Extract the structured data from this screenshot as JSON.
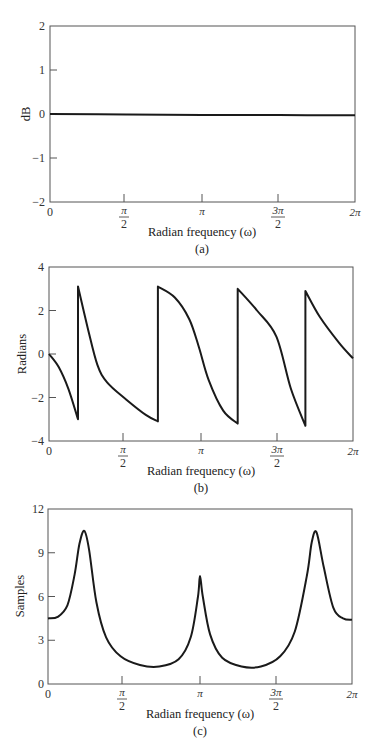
{
  "figure": {
    "panels": [
      {
        "id": "a",
        "caption": "(a)",
        "ylabel": "dB",
        "xlabel": "Radian frequency (ω)",
        "ytick_labels": [
          "2",
          "1",
          "0",
          "−1",
          "−2"
        ],
        "xtick_labels": [
          "0",
          "π/2",
          "π",
          "3π/2",
          "2π"
        ]
      },
      {
        "id": "b",
        "caption": "(b)",
        "ylabel": "Radians",
        "xlabel": "Radian frequency (ω)",
        "ytick_labels": [
          "4",
          "2",
          "0",
          "−2",
          "−4"
        ],
        "xtick_labels": [
          "0",
          "π/2",
          "π",
          "3π/2",
          "2π"
        ]
      },
      {
        "id": "c",
        "caption": "(c)",
        "ylabel": "Samples",
        "xlabel": "Radian frequency (ω)",
        "ytick_labels": [
          "12",
          "9",
          "6",
          "3",
          "0"
        ],
        "xtick_labels": [
          "0",
          "π/2",
          "π",
          "3π/2",
          "2π"
        ]
      }
    ],
    "line_color": "#1a1a1a",
    "frame_color": "#555555"
  },
  "chart_data": [
    {
      "type": "line",
      "title": "",
      "caption": "(a)",
      "xlabel": "Radian frequency (ω)",
      "ylabel": "dB",
      "xlim": [
        0,
        6.2832
      ],
      "ylim": [
        -2,
        2
      ],
      "xticks": [
        0,
        1.5708,
        3.1416,
        4.7124,
        6.2832
      ],
      "xtick_labels": [
        "0",
        "π/2",
        "π",
        "3π/2",
        "2π"
      ],
      "yticks": [
        -2,
        -1,
        0,
        1,
        2
      ],
      "grid": false,
      "series": [
        {
          "name": "magnitude",
          "x": [
            0,
            1.5708,
            3.1416,
            4.7124,
            6.2832
          ],
          "y": [
            0,
            -0.01,
            -0.02,
            -0.025,
            -0.03
          ]
        }
      ]
    },
    {
      "type": "line",
      "title": "",
      "caption": "(b)",
      "xlabel": "Radian frequency (ω)",
      "ylabel": "Radians",
      "xlim": [
        0,
        6.2832
      ],
      "ylim": [
        -4,
        4
      ],
      "xticks": [
        0,
        1.5708,
        3.1416,
        4.7124,
        6.2832
      ],
      "xtick_labels": [
        "0",
        "π/2",
        "π",
        "3π/2",
        "2π"
      ],
      "yticks": [
        -4,
        -2,
        0,
        2,
        4
      ],
      "grid": false,
      "series": [
        {
          "name": "phase",
          "x": [
            0,
            0.2,
            0.4,
            0.6,
            0.6,
            0.8,
            1.0,
            1.2,
            1.6,
            2.0,
            2.25,
            2.25,
            2.6,
            2.9,
            3.1,
            3.3,
            3.6,
            3.9,
            3.9,
            4.3,
            4.7,
            5.0,
            5.3,
            5.3,
            5.6,
            6.0,
            6.2832
          ],
          "y": [
            0,
            -0.6,
            -1.6,
            -3.0,
            3.1,
            1.2,
            -0.5,
            -1.3,
            -2.1,
            -2.8,
            -3.1,
            3.1,
            2.6,
            1.6,
            0.3,
            -1.2,
            -2.6,
            -3.2,
            3.0,
            2.0,
            0.8,
            -1.6,
            -3.3,
            2.9,
            1.7,
            0.5,
            -0.2
          ]
        }
      ]
    },
    {
      "type": "line",
      "title": "",
      "caption": "(c)",
      "xlabel": "Radian frequency (ω)",
      "ylabel": "Samples",
      "xlim": [
        0,
        6.2832
      ],
      "ylim": [
        0,
        12
      ],
      "xticks": [
        0,
        1.5708,
        3.1416,
        4.7124,
        6.2832
      ],
      "xtick_labels": [
        "0",
        "π/2",
        "π",
        "3π/2",
        "2π"
      ],
      "yticks": [
        0,
        3,
        6,
        9,
        12
      ],
      "grid": false,
      "series": [
        {
          "name": "group delay",
          "x": [
            0,
            0.2,
            0.4,
            0.55,
            0.65,
            0.75,
            0.85,
            1.0,
            1.2,
            1.5,
            1.9,
            2.3,
            2.7,
            2.95,
            3.1,
            3.1416,
            3.2,
            3.35,
            3.6,
            4.0,
            4.4,
            4.8,
            5.1,
            5.35,
            5.45,
            5.55,
            5.7,
            5.9,
            6.1,
            6.2832
          ],
          "y": [
            4.5,
            4.6,
            5.4,
            7.5,
            9.6,
            10.5,
            9.2,
            5.6,
            3.2,
            1.9,
            1.3,
            1.2,
            1.7,
            3.2,
            6.0,
            7.4,
            6.0,
            3.4,
            1.8,
            1.2,
            1.2,
            1.9,
            3.6,
            7.4,
            9.7,
            10.4,
            8.0,
            5.2,
            4.5,
            4.4
          ]
        }
      ]
    }
  ]
}
